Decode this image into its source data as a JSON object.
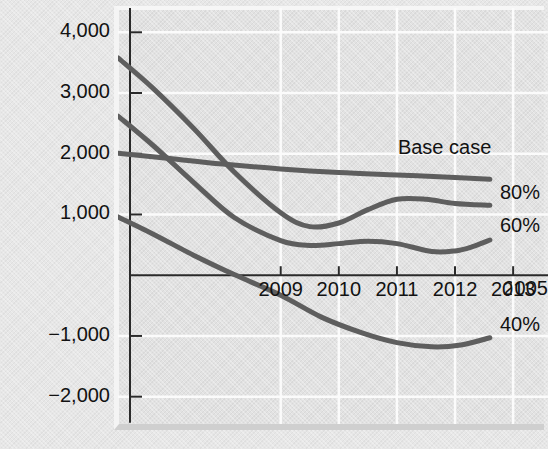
{
  "chart_data": {
    "type": "line",
    "title": "",
    "xlabel": "",
    "ylabel": "Annual cash flow (£000)",
    "grid": true,
    "legend_position": "right-inline-labels",
    "xlim": [
      2006.2,
      2013.6
    ],
    "ylim": [
      -2450,
      4400
    ],
    "yticks": [
      4000,
      3000,
      2000,
      1000,
      -1000,
      -2000
    ],
    "ytick_labels": [
      "4,000",
      "3,000",
      "2,000",
      "1,000",
      "−1,000",
      "−2,000"
    ],
    "xticks": [
      2009,
      2010,
      2011,
      2012,
      2013
    ],
    "xtick_labels": [
      "2009",
      "2010",
      "2011",
      "2012",
      "2013"
    ],
    "origin_label": "2005",
    "series": [
      {
        "name": "Base case",
        "label": "Base case",
        "color": "#5e5e5e",
        "x": [
          2006.2,
          2007.0,
          2008.0,
          2009.0,
          2010.0,
          2011.0,
          2012.0,
          2012.6
        ],
        "values": [
          2010,
          1930,
          1830,
          1750,
          1690,
          1650,
          1610,
          1580
        ]
      },
      {
        "name": "80%",
        "label": "80%",
        "color": "#5e5e5e",
        "x": [
          2006.2,
          2006.8,
          2007.5,
          2008.2,
          2009.0,
          2009.5,
          2010.0,
          2010.5,
          2011.0,
          2011.5,
          2012.0,
          2012.6
        ],
        "values": [
          3580,
          3080,
          2420,
          1700,
          1030,
          800,
          860,
          1080,
          1250,
          1250,
          1180,
          1150
        ]
      },
      {
        "name": "60%",
        "label": "60%",
        "color": "#5e5e5e",
        "x": [
          2006.2,
          2006.8,
          2007.5,
          2008.2,
          2009.0,
          2009.5,
          2010.0,
          2010.5,
          2011.0,
          2011.6,
          2012.0,
          2012.3,
          2012.6
        ],
        "values": [
          2620,
          2140,
          1530,
          950,
          570,
          490,
          520,
          560,
          520,
          390,
          400,
          470,
          580
        ]
      },
      {
        "name": "40%",
        "label": "40%",
        "color": "#5e5e5e",
        "x": [
          2006.2,
          2006.8,
          2007.5,
          2008.2,
          2009.0,
          2009.7,
          2010.4,
          2011.0,
          2011.6,
          2012.1,
          2012.6
        ],
        "values": [
          960,
          680,
          330,
          10,
          -330,
          -690,
          -950,
          -1110,
          -1180,
          -1150,
          -1030
        ]
      }
    ]
  },
  "axis": {
    "y_title": "Annual cash flow (£000)",
    "origin_tick_label": "2005"
  },
  "style": {
    "line_color": "#5e5e5e",
    "axis_color": "#2a2a2a",
    "grid_color": "#fbfbfb",
    "text_color": "#121212",
    "panel_color": "#e2e2e2",
    "page_color": "#e8e8e8"
  }
}
